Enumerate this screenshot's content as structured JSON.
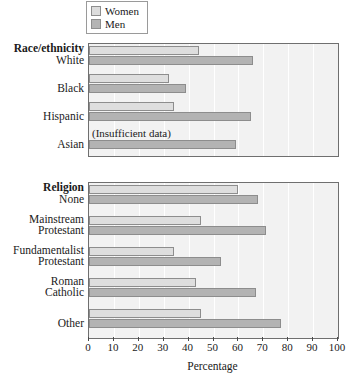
{
  "legend": {
    "items": [
      {
        "label": "Women",
        "color": "#dedede",
        "key": "women"
      },
      {
        "label": "Men",
        "color": "#b3b3b3",
        "key": "men"
      }
    ]
  },
  "axis": {
    "title": "Percentage",
    "ticks": [
      "0",
      "10",
      "20",
      "30",
      "40",
      "50",
      "60",
      "70",
      "80",
      "90",
      "100"
    ]
  },
  "panels": [
    {
      "title": "Race/ethnicity",
      "categories": [
        "White",
        "Black",
        "Hispanic",
        "Asian"
      ]
    },
    {
      "title": "Religion",
      "categories": [
        "None",
        "Mainstream\nProtestant",
        "Fundamentalist\nProtestant",
        "Roman\nCatholic",
        "Other"
      ]
    }
  ],
  "notes": {
    "insufficient": "(Insufficient data)"
  },
  "chart_data": {
    "type": "bar",
    "orientation": "horizontal",
    "title": "",
    "xlabel": "Percentage",
    "ylabel": "",
    "xlim": [
      0,
      100
    ],
    "xticks": [
      0,
      10,
      20,
      30,
      40,
      50,
      60,
      70,
      80,
      90,
      100
    ],
    "grid": true,
    "legend_position": "top",
    "panels": [
      {
        "name": "Race/ethnicity",
        "categories": [
          "White",
          "Black",
          "Hispanic",
          "Asian"
        ],
        "series": [
          {
            "name": "Women",
            "color": "#dedede",
            "values": [
              44,
              32,
              34,
              null
            ]
          },
          {
            "name": "Men",
            "color": "#b3b3b3",
            "values": [
              66,
              39,
              65,
              59
            ]
          }
        ],
        "annotations": [
          {
            "category": "Asian",
            "series": "Women",
            "text": "(Insufficient data)"
          }
        ]
      },
      {
        "name": "Religion",
        "categories": [
          "None",
          "Mainstream Protestant",
          "Fundamentalist Protestant",
          "Roman Catholic",
          "Other"
        ],
        "series": [
          {
            "name": "Women",
            "color": "#dedede",
            "values": [
              60,
              45,
              34,
              43,
              45
            ]
          },
          {
            "name": "Men",
            "color": "#b3b3b3",
            "values": [
              68,
              71,
              53,
              67,
              77
            ]
          }
        ],
        "annotations": []
      }
    ]
  }
}
